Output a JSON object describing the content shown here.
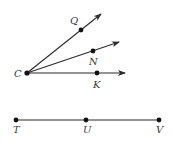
{
  "diagram": {
    "type": "geometry",
    "colors": {
      "line": "#2b2b2b",
      "point": "#111111",
      "label": "#3a3a3a",
      "background": "#ffffff"
    },
    "rays": {
      "vertex": {
        "label": "C",
        "x": 27,
        "y": 73
      },
      "items": [
        {
          "name": "ray-CQ",
          "point_label": "Q",
          "point": {
            "x": 81,
            "y": 30
          },
          "tip": {
            "x": 101,
            "y": 14
          },
          "label_pos": {
            "x": 70,
            "y": 24
          }
        },
        {
          "name": "ray-CN",
          "point_label": "N",
          "point": {
            "x": 93,
            "y": 51
          },
          "tip": {
            "x": 119,
            "y": 42
          },
          "label_pos": {
            "x": 89,
            "y": 65
          }
        },
        {
          "name": "ray-CK",
          "point_label": "K",
          "point": {
            "x": 97,
            "y": 73
          },
          "tip": {
            "x": 125,
            "y": 73
          },
          "label_pos": {
            "x": 93,
            "y": 88
          }
        }
      ]
    },
    "segment": {
      "y": 120,
      "points": [
        {
          "label": "T",
          "x": 16
        },
        {
          "label": "U",
          "x": 86
        },
        {
          "label": "V",
          "x": 159
        }
      ]
    }
  }
}
